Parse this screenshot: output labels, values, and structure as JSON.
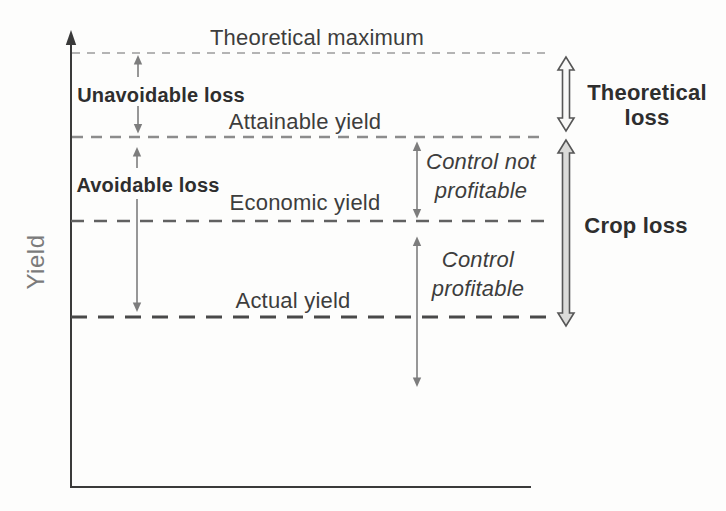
{
  "diagram": {
    "y_axis_label": "Yield",
    "yield_levels": [
      {
        "label": "Theoretical maximum"
      },
      {
        "label": "Attainable yield"
      },
      {
        "label": "Economic yield"
      },
      {
        "label": "Actual yield"
      }
    ],
    "loss_arrows": [
      {
        "label": "Unavoidable loss"
      },
      {
        "label": "Avoidable loss"
      }
    ],
    "control_zones": [
      {
        "label": "Control not profitable"
      },
      {
        "label": "Control profitable"
      }
    ],
    "summary_arrows": [
      {
        "label": "Theoretical loss"
      },
      {
        "label": "Crop loss"
      }
    ],
    "colors": {
      "axis": "#3a3a3a",
      "theoretical_max_line": "#b4b4b4",
      "attainable_line": "#8c8c8c",
      "economic_line": "#616161",
      "actual_line": "#494949",
      "thin_arrow": "#7d7d7d",
      "big_arrow_outline": "#565656",
      "theoretical_loss_arrow_fill": "#f8f8f7",
      "crop_loss_arrow_fill": "#dbdbd9",
      "text": "#3d3d3d",
      "bold_text": "#2e2e2e",
      "axis_label_text": "#7b7b7b"
    }
  }
}
